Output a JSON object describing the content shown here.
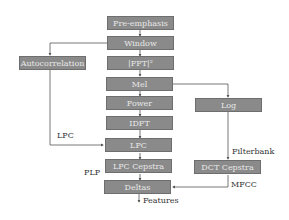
{
  "diagram": {
    "colors": {
      "box_fill": "#8a8a8a",
      "box_border": "#6e6e6e",
      "box_text": "#e8e8e8",
      "line": "#555555",
      "label": "#333333"
    },
    "nodes": {
      "pre_emphasis": "Pre-emphasis",
      "window": "Window",
      "fft": "|FFT|²",
      "mel": "Mel",
      "power": "Power",
      "idft": "IDFT",
      "lpc": "LPC",
      "lpc_cepstra": "LPC Cepstra",
      "deltas": "Deltas",
      "autocorrelation": "Autocorrelation",
      "log": "Log",
      "dct_cepstra": "DCT Cepstra"
    },
    "labels": {
      "lpc": "LPC",
      "plp": "PLP",
      "filterbank": "Filterbank",
      "mfcc": "MFCC",
      "features": "Features"
    },
    "edges": [
      [
        "Pre-emphasis",
        "Window"
      ],
      [
        "Window",
        "|FFT|²"
      ],
      [
        "Window",
        "Autocorrelation"
      ],
      [
        "|FFT|²",
        "Mel"
      ],
      [
        "Mel",
        "Power"
      ],
      [
        "Mel",
        "Log"
      ],
      [
        "Power",
        "IDFT"
      ],
      [
        "IDFT",
        "LPC"
      ],
      [
        "Autocorrelation",
        "LPC"
      ],
      [
        "LPC",
        "LPC Cepstra"
      ],
      [
        "LPC Cepstra",
        "Deltas"
      ],
      [
        "Log",
        "DCT Cepstra"
      ],
      [
        "DCT Cepstra",
        "Deltas"
      ],
      [
        "Deltas",
        "Features"
      ]
    ]
  }
}
